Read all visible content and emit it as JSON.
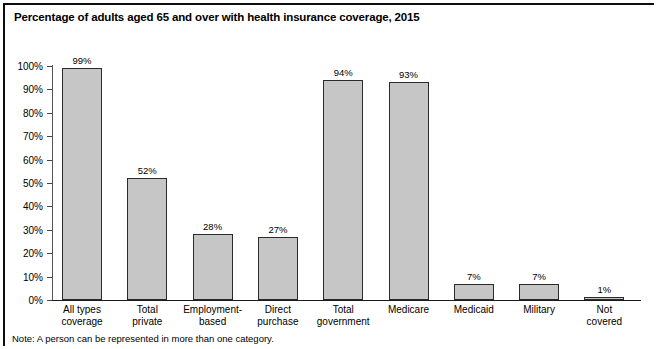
{
  "figure": {
    "title": "Percentage of adults aged 65 and over with health insurance coverage, 2015",
    "note": "Note: A person can be represented in more than one category.",
    "border_color": "#0d0d0d",
    "background": "#ffffff"
  },
  "chart_data": {
    "type": "bar",
    "title": "Percentage of adults aged 65 and over with health insurance coverage, 2015",
    "xlabel": "",
    "ylabel": "",
    "ylim": [
      0,
      100
    ],
    "yticks": [
      "0%",
      "10%",
      "20%",
      "30%",
      "40%",
      "50%",
      "60%",
      "70%",
      "80%",
      "90%",
      "100%"
    ],
    "ytick_values": [
      0,
      10,
      20,
      30,
      40,
      50,
      60,
      70,
      80,
      90,
      100
    ],
    "grid": false,
    "legend": false,
    "bar_fill": "#c6c6c6",
    "bar_edge": "#2b2b2b",
    "categories": [
      "All types coverage",
      "Total private",
      "Employment-based",
      "Direct purchase",
      "Total government",
      "Medicare",
      "Medicaid",
      "Military",
      "Not covered"
    ],
    "category_lines": [
      [
        "All types",
        "coverage"
      ],
      [
        "Total",
        "private"
      ],
      [
        "Employment-",
        "based"
      ],
      [
        "Direct",
        "purchase"
      ],
      [
        "Total",
        "government"
      ],
      [
        "Medicare",
        ""
      ],
      [
        "Medicaid",
        ""
      ],
      [
        "Military",
        ""
      ],
      [
        "Not",
        "covered"
      ]
    ],
    "values": [
      99,
      52,
      28,
      27,
      94,
      93,
      7,
      7,
      1
    ],
    "value_labels": [
      "99%",
      "52%",
      "28%",
      "27%",
      "94%",
      "93%",
      "7%",
      "7%",
      "1%"
    ],
    "note": "Note: A person can be represented in more than one category."
  }
}
